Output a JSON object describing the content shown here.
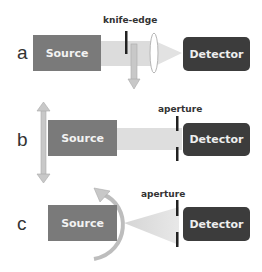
{
  "panels": [
    {
      "label": "a",
      "source": "Source",
      "detector": "Detector",
      "annotation": "knife-edge"
    },
    {
      "label": "b",
      "source": "Source",
      "detector": "Detector",
      "annotation": "aperture"
    },
    {
      "label": "c",
      "source": "Source",
      "detector": "Detector",
      "annotation": "aperture"
    }
  ],
  "colors": {
    "source": "#7a7a7a",
    "detector": "#3c3c3c",
    "beam": "#d8d8d8",
    "arrow": "#bdbdbd"
  }
}
